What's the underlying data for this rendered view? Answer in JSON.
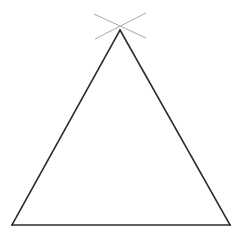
{
  "figure": {
    "type": "line-drawing",
    "canvas": {
      "width": 242,
      "height": 238,
      "background_color": "#ffffff"
    },
    "triangle": {
      "name": "isosceles-triangle",
      "stroke_color": "#2b2b2b",
      "stroke_width": 1.6,
      "fill": "none",
      "vertices": {
        "apex": {
          "label": "apex",
          "x": 120,
          "y": 30
        },
        "base_left": {
          "label": "base-left",
          "x": 12,
          "y": 225
        },
        "base_right": {
          "label": "base-right",
          "x": 230,
          "y": 225
        }
      },
      "edges": [
        {
          "name": "left-side",
          "from": "apex",
          "to": "base_left",
          "path": "M 120 30 L 12 225"
        },
        {
          "name": "right-side",
          "from": "apex",
          "to": "base_right",
          "path": "M 120 30 L 230 225"
        },
        {
          "name": "base",
          "from": "base_left",
          "to": "base_right",
          "path": "M 12 225 L 230 225"
        }
      ]
    },
    "construction_marks": {
      "name": "apex-arc-intersection",
      "description": "Two light crossing construction lines forming an X through the apex",
      "stroke_color": "#a8a8a8",
      "stroke_width": 1,
      "lines": [
        {
          "name": "construction-line-ne-sw",
          "path": "M 146 13 L 95 39"
        },
        {
          "name": "construction-line-nw-se",
          "path": "M 94 14 L 146 38"
        }
      ]
    }
  }
}
